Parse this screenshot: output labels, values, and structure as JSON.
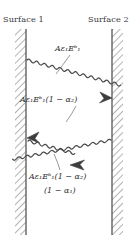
{
  "figure": {
    "width": 138,
    "height": 247,
    "background": "#ffffff",
    "line_color": "#4a4a4a",
    "hatch_color": "#9a9a9a",
    "text_color": "#2e2e2e"
  },
  "surfaces": {
    "left": {
      "label": "Surface 1"
    },
    "right": {
      "label": "Surface 2"
    }
  },
  "rays": [
    {
      "id": "ray-1",
      "label_plain": "Aε₁Eᵇ₁",
      "label_parts": {
        "a": "A",
        "eps": "ε",
        "eps_sub": "1",
        "e": "E",
        "e_sub": "b1"
      },
      "direction": "down-right",
      "from": "surface-1",
      "to": "surface-2"
    },
    {
      "id": "ray-2",
      "label_plain": "Aε₁Eᵇ₁(1 − α₂)",
      "label_parts": {
        "a": "A",
        "eps": "ε",
        "eps_sub": "1",
        "e": "E",
        "e_sub": "b1",
        "factor_open": "(1 − ",
        "alpha": "α",
        "alpha_sub": "2",
        "factor_close": ")"
      },
      "direction": "down-left",
      "from": "surface-2",
      "to": "surface-1"
    },
    {
      "id": "ray-3",
      "label_line1_plain": "Aε₁Eᵇ₁(1 − α₂)",
      "label_line2_plain": "(1 − α₁)",
      "label_parts": {
        "a": "A",
        "eps": "ε",
        "eps_sub": "1",
        "e": "E",
        "e_sub": "b1",
        "factor_open": "(1 − ",
        "alpha2": "α",
        "alpha2_sub": "2",
        "factor_close": ")",
        "line2_open": "(1 − ",
        "alpha1": "α",
        "alpha1_sub": "1",
        "line2_close": ")"
      },
      "direction": "down-right",
      "from": "surface-1",
      "to": "open-space"
    }
  ]
}
